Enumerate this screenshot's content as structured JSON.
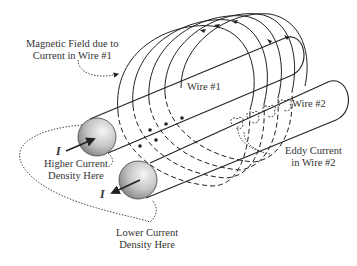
{
  "diagram": {
    "labels": {
      "magnetic_field_line1": "Magnetic Field due to",
      "magnetic_field_line2": "Current in Wire #1",
      "wire1": "Wire #1",
      "wire2": "Wire #2",
      "eddy_line1": "Eddy Current",
      "eddy_line2": "in Wire #2",
      "higher_line1": "Higher Current",
      "higher_line2": "Density Here",
      "lower_line1": "Lower Current",
      "lower_line2": "Density Here",
      "current_symbol_1": "I",
      "current_symbol_2": "I"
    },
    "colors": {
      "stroke": "#222222",
      "sphere_light": "#f4f4f4",
      "sphere_dark": "#8a8a8a"
    }
  }
}
